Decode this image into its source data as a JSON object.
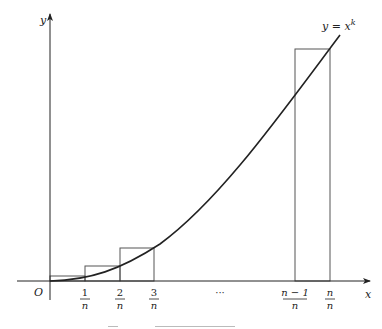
{
  "diagram": {
    "curve_label": "y = x",
    "curve_exponent": "k",
    "x_axis_label": "x",
    "y_axis_label": "y",
    "origin_label": "O",
    "ellipsis": "···",
    "ticks": [
      {
        "num": "1",
        "den": "n",
        "x": 85
      },
      {
        "num": "2",
        "den": "n",
        "x": 120
      },
      {
        "num": "3",
        "den": "n",
        "x": 154
      },
      {
        "num": "n − 1",
        "den": "n",
        "x": 295
      },
      {
        "num": "n",
        "den": "n",
        "x": 330
      }
    ],
    "rectangles": [
      {
        "x0": 50,
        "x1": 85,
        "top": 276
      },
      {
        "x0": 85,
        "x1": 120,
        "top": 266
      },
      {
        "x0": 120,
        "x1": 154,
        "top": 248
      },
      {
        "x0": 295,
        "x1": 330,
        "top": 49
      }
    ],
    "colors": {
      "line": "#222222",
      "rect": "#555555",
      "background": "#ffffff"
    }
  }
}
